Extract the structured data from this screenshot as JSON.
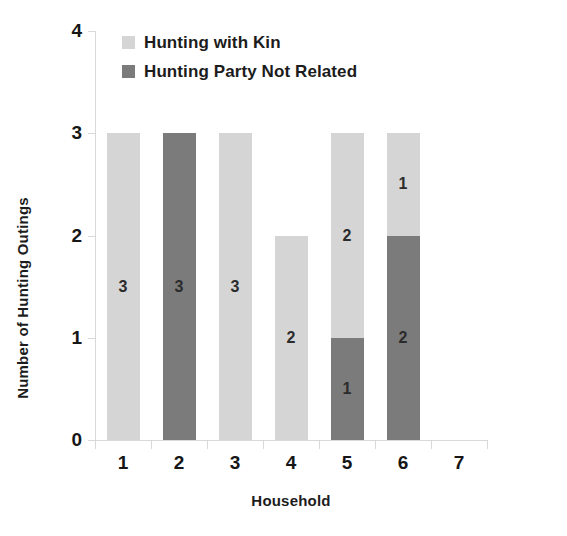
{
  "chart_data": {
    "type": "bar",
    "subtype": "stacked-bar",
    "title": "",
    "xlabel": "Household",
    "ylabel": "Number of Hunting Outings",
    "categories": [
      "1",
      "2",
      "3",
      "4",
      "5",
      "6",
      "7"
    ],
    "ylim": [
      0,
      4
    ],
    "yticks": [
      0,
      1,
      2,
      3,
      4
    ],
    "ytick_labels": [
      "0",
      "1",
      "2",
      "3",
      "4"
    ],
    "grid": false,
    "legend_position": "top-left-inside",
    "series": [
      {
        "name": "Hunting with Kin",
        "color": "#d5d5d5",
        "values": [
          3,
          0,
          3,
          2,
          2,
          1,
          0
        ],
        "data_labels": [
          "3",
          "",
          "3",
          "2",
          "2",
          "1",
          ""
        ]
      },
      {
        "name": "Hunting Party Not Related",
        "color": "#7b7b7b",
        "values": [
          0,
          3,
          0,
          0,
          1,
          2,
          0
        ],
        "data_labels": [
          "",
          "3",
          "",
          "",
          "1",
          "2",
          ""
        ]
      }
    ],
    "totals": [
      3,
      3,
      3,
      2,
      3,
      3,
      0
    ],
    "stack_order_bottom_to_top": [
      "Hunting Party Not Related",
      "Hunting with Kin"
    ]
  },
  "legend": {
    "items": [
      {
        "label": "Hunting with Kin",
        "color": "#d5d5d5"
      },
      {
        "label": "Hunting Party Not Related",
        "color": "#7b7b7b"
      }
    ]
  },
  "axes": {
    "y_title": "Number of Hunting Outings",
    "x_title": "Household"
  },
  "colors": {
    "light_series": "#d5d5d5",
    "dark_series": "#7b7b7b",
    "axis": "#d9d9d9",
    "text": "#161616",
    "background": "#ffffff"
  }
}
